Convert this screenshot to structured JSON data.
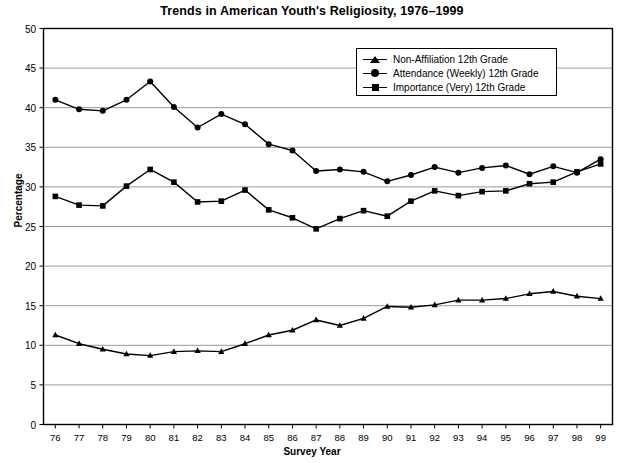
{
  "chart_data": {
    "type": "line",
    "title": "Trends in American Youth's Religiosity, 1976–1999",
    "xlabel": "Survey Year",
    "ylabel": "Percentage",
    "grid": true,
    "legend_position": "top-right",
    "xlim": [
      75.5,
      99.5
    ],
    "ylim": [
      0,
      50
    ],
    "yticks": [
      0,
      5,
      10,
      15,
      20,
      25,
      30,
      35,
      40,
      45,
      50
    ],
    "categories": [
      "76",
      "77",
      "78",
      "79",
      "80",
      "81",
      "82",
      "83",
      "84",
      "85",
      "86",
      "87",
      "88",
      "89",
      "90",
      "91",
      "92",
      "93",
      "94",
      "95",
      "96",
      "97",
      "98",
      "99"
    ],
    "x": [
      1976,
      1977,
      1978,
      1979,
      1980,
      1981,
      1982,
      1983,
      1984,
      1985,
      1986,
      1987,
      1988,
      1989,
      1990,
      1991,
      1992,
      1993,
      1994,
      1995,
      1996,
      1997,
      1998,
      1999
    ],
    "series": [
      {
        "name": "Non-Affiliation 12th Grade",
        "marker": "triangle",
        "color": "#000000",
        "values": [
          11.3,
          10.2,
          9.5,
          8.9,
          8.7,
          9.2,
          9.3,
          9.2,
          10.2,
          11.3,
          11.9,
          13.2,
          12.5,
          13.4,
          14.9,
          14.8,
          15.1,
          15.7,
          15.7,
          15.9,
          16.5,
          16.8,
          16.2,
          15.9
        ]
      },
      {
        "name": "Attendance (Weekly) 12th Grade",
        "marker": "circle",
        "color": "#000000",
        "values": [
          41.0,
          39.8,
          39.6,
          41.0,
          43.3,
          40.1,
          37.5,
          39.2,
          37.9,
          35.4,
          34.6,
          32.0,
          32.2,
          31.9,
          30.7,
          31.5,
          32.5,
          31.8,
          32.4,
          32.7,
          31.6,
          32.6,
          31.8,
          33.5
        ]
      },
      {
        "name": "Importance (Very) 12th Grade",
        "marker": "square",
        "color": "#000000",
        "values": [
          28.8,
          27.7,
          27.6,
          30.1,
          32.2,
          30.6,
          28.1,
          28.2,
          29.6,
          27.1,
          26.1,
          24.7,
          26.0,
          27.0,
          26.3,
          28.2,
          29.5,
          28.9,
          29.4,
          29.5,
          30.4,
          30.6,
          31.9,
          32.9
        ]
      }
    ]
  },
  "legend": {
    "items": [
      {
        "label": "Non-Affiliation 12th Grade",
        "marker": "triangle"
      },
      {
        "label": "Attendance (Weekly) 12th Grade",
        "marker": "circle"
      },
      {
        "label": "Importance (Very) 12th Grade",
        "marker": "square"
      }
    ]
  }
}
